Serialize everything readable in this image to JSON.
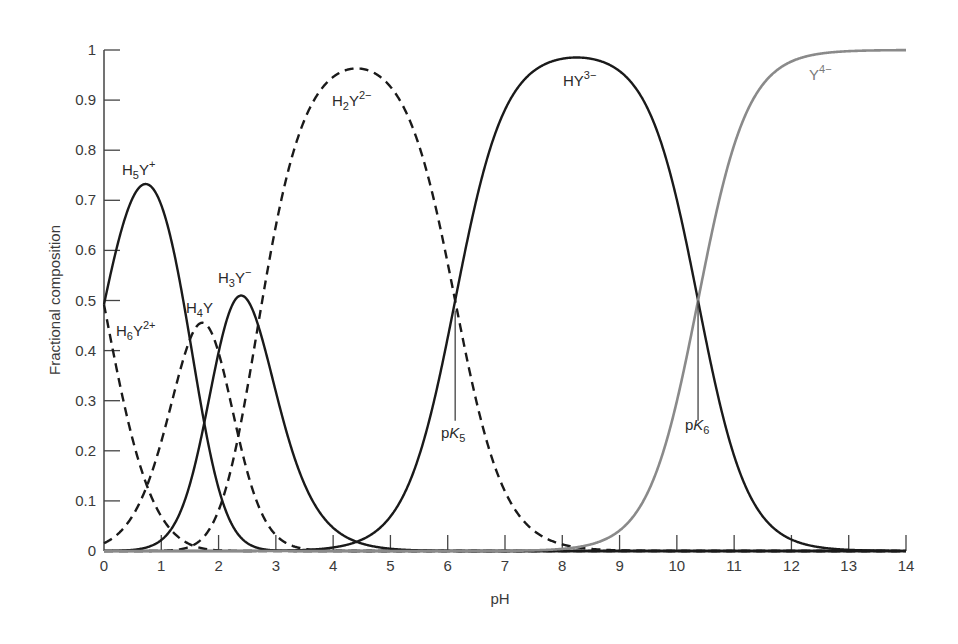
{
  "chart_data": {
    "type": "line",
    "title": "",
    "xlabel": "pH",
    "ylabel": "Fractional composition",
    "xlim": [
      0,
      14
    ],
    "ylim": [
      0,
      1
    ],
    "grid": false,
    "legend": "none (curves labeled inline)",
    "x_ticks": [
      "0",
      "1",
      "2",
      "3",
      "4",
      "5",
      "6",
      "7",
      "8",
      "9",
      "10",
      "11",
      "12",
      "13",
      "14"
    ],
    "y_ticks": [
      "0",
      "0.1",
      "0.2",
      "0.3",
      "0.4",
      "0.5",
      "0.6",
      "0.7",
      "0.8",
      "0.9",
      "1"
    ],
    "pKa": [
      0.0,
      1.5,
      2.0,
      2.69,
      6.13,
      10.37
    ],
    "annotations": [
      {
        "text": "pK5",
        "x": 6.13,
        "y_from": 0.26,
        "y_to": 0.48
      },
      {
        "text": "pK6",
        "x": 10.37,
        "y_from": 0.26,
        "y_to": 0.5
      }
    ],
    "x": [
      0,
      0.5,
      1,
      1.5,
      2,
      2.5,
      3,
      3.5,
      4,
      4.5,
      5,
      5.5,
      6,
      6.5,
      7,
      7.5,
      8,
      8.5,
      9,
      9.5,
      10,
      10.5,
      11,
      11.5,
      12,
      12.5,
      13,
      13.5,
      14
    ],
    "series": [
      {
        "name": "H6Y2+",
        "label": "H₆Y²⁺",
        "style": "dashed",
        "color": "#1a1a1a",
        "values": [
          0.49,
          0.22,
          0.07,
          0.01,
          0.0,
          0,
          0,
          0,
          0,
          0,
          0,
          0,
          0,
          0,
          0,
          0,
          0,
          0,
          0,
          0,
          0,
          0,
          0,
          0,
          0,
          0,
          0,
          0,
          0
        ]
      },
      {
        "name": "H5Y+",
        "label": "H₅Y⁺",
        "style": "solid",
        "color": "#1a1a1a",
        "values": [
          0.49,
          0.7,
          0.66,
          0.38,
          0.12,
          0.02,
          0.0,
          0,
          0,
          0,
          0,
          0,
          0,
          0,
          0,
          0,
          0,
          0,
          0,
          0,
          0,
          0,
          0,
          0,
          0,
          0,
          0,
          0,
          0
        ]
      },
      {
        "name": "H4Y",
        "label": "H₄Y",
        "style": "dashed",
        "color": "#1a1a1a",
        "values": [
          0.02,
          0.07,
          0.21,
          0.38,
          0.38,
          0.17,
          0.04,
          0.01,
          0.0,
          0,
          0,
          0,
          0,
          0,
          0,
          0,
          0,
          0,
          0,
          0,
          0,
          0,
          0,
          0,
          0,
          0,
          0,
          0,
          0
        ]
      },
      {
        "name": "H3Y-",
        "label": "H₃Y⁻",
        "style": "solid",
        "color": "#1a1a1a",
        "values": [
          0.0,
          0.01,
          0.07,
          0.38,
          0.38,
          0.53,
          0.33,
          0.1,
          0.03,
          0.01,
          0.0,
          0,
          0,
          0,
          0,
          0,
          0,
          0,
          0,
          0,
          0,
          0,
          0,
          0,
          0,
          0,
          0,
          0,
          0
        ]
      },
      {
        "name": "H2Y2-",
        "label": "H₂Y²⁻",
        "style": "dashed",
        "color": "#1a1a1a",
        "values": [
          0,
          0.0,
          0.01,
          0.04,
          0.12,
          0.3,
          0.67,
          0.88,
          0.96,
          0.97,
          0.93,
          0.81,
          0.57,
          0.3,
          0.12,
          0.04,
          0.01,
          0.0,
          0,
          0,
          0,
          0,
          0,
          0,
          0,
          0,
          0,
          0,
          0
        ]
      },
      {
        "name": "HY3-",
        "label": "HY³⁻",
        "style": "solid",
        "color": "#1a1a1a",
        "values": [
          0,
          0,
          0,
          0,
          0,
          0,
          0.0,
          0.0,
          0.01,
          0.02,
          0.07,
          0.19,
          0.43,
          0.7,
          0.88,
          0.95,
          0.97,
          0.96,
          0.95,
          0.87,
          0.7,
          0.43,
          0.19,
          0.07,
          0.02,
          0.01,
          0.0,
          0.0,
          0
        ]
      },
      {
        "name": "Y4-",
        "label": "Y⁴⁻",
        "style": "solid",
        "color": "#8a8a8a",
        "values": [
          0,
          0,
          0,
          0,
          0,
          0,
          0,
          0,
          0,
          0,
          0,
          0,
          0,
          0,
          0,
          0,
          0.0,
          0.01,
          0.04,
          0.13,
          0.3,
          0.57,
          0.81,
          0.93,
          0.98,
          0.99,
          1.0,
          1.0,
          1.0
        ]
      }
    ]
  },
  "labels": {
    "x_axis_title": "pH",
    "y_axis_title": "Fractional composition",
    "H6Y": {
      "base": "H",
      "sub": "6",
      "mid": "Y",
      "sup": "2+"
    },
    "H5Y": {
      "base": "H",
      "sub": "5",
      "mid": "Y",
      "sup": "+"
    },
    "H4Y": {
      "base": "H",
      "sub": "4",
      "mid": "Y",
      "sup": ""
    },
    "H3Y": {
      "base": "H",
      "sub": "3",
      "mid": "Y",
      "sup": "−"
    },
    "H2Y": {
      "base": "H",
      "sub": "2",
      "mid": "Y",
      "sup": "2−"
    },
    "HY": {
      "base": "HY",
      "sub": "",
      "mid": "",
      "sup": "3−"
    },
    "Y": {
      "base": "Y",
      "sub": "",
      "mid": "",
      "sup": "4−"
    },
    "pK5": {
      "base": "p",
      "k": "K",
      "sub": "5"
    },
    "pK6": {
      "base": "p",
      "k": "K",
      "sub": "6"
    }
  }
}
